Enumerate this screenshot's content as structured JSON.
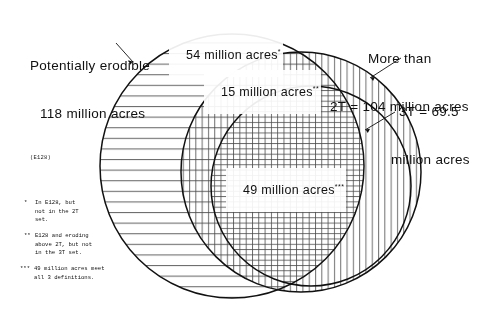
{
  "figure": {
    "type": "venn-diagram",
    "title_left": {
      "line1": "Potentially erodible",
      "line2": "118 million acres",
      "code": "(E128)"
    },
    "title_right_2t": {
      "line1": "More than",
      "line2": "2T = 104 million acres"
    },
    "title_right_3t": {
      "line1": "3T = 69.5",
      "line2": "million acres"
    },
    "regions": [
      {
        "id": "e128-only",
        "label": "54 million acres",
        "marker": "*",
        "value": 54,
        "unit": "million acres",
        "hatch": "horizontal-lines"
      },
      {
        "id": "e128-and-2t-not-3t",
        "label": "15 million acres",
        "marker": "**",
        "value": 15,
        "unit": "million acres",
        "hatch": "cross-grid"
      },
      {
        "id": "all-three",
        "label": "49 million acres",
        "marker": "***",
        "value": 49,
        "unit": "million acres",
        "hatch": "fine-grid"
      }
    ],
    "sets": [
      {
        "id": "e128",
        "name": "Potentially erodible (E128)",
        "total": 118,
        "unit": "million acres"
      },
      {
        "id": "2t",
        "name": "More than 2T",
        "total": 104,
        "unit": "million acres"
      },
      {
        "id": "3t",
        "name": "3T",
        "total": 69.5,
        "unit": "million acres"
      }
    ],
    "footnotes": [
      {
        "marker": "*",
        "text": "In E128, but\nnot in the 2T\nset."
      },
      {
        "marker": "**",
        "text": "E128 and eroding\nabove 2T, but not\nin the 3T set."
      },
      {
        "marker": "***",
        "text": "49 million acres meet\nall 3 definitions."
      }
    ],
    "colors": {
      "stroke": "#111111",
      "hatch": "#555555",
      "background": "#ffffff",
      "text": "#111111"
    }
  }
}
